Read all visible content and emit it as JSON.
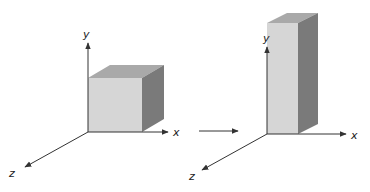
{
  "colors": {
    "front_face": "#d6d6d6",
    "top_face": "#a9a9a9",
    "side_face": "#7a7a7a",
    "axis": "#333333"
  },
  "left_figure": {
    "name": "cube",
    "axes": {
      "x_label": "x",
      "y_label": "y",
      "z_label": "z"
    }
  },
  "transition_arrow": {
    "direction": "right"
  },
  "right_figure": {
    "name": "tall-rectangular-prism",
    "axes": {
      "x_label": "x",
      "y_label": "y",
      "z_label": "z"
    }
  }
}
